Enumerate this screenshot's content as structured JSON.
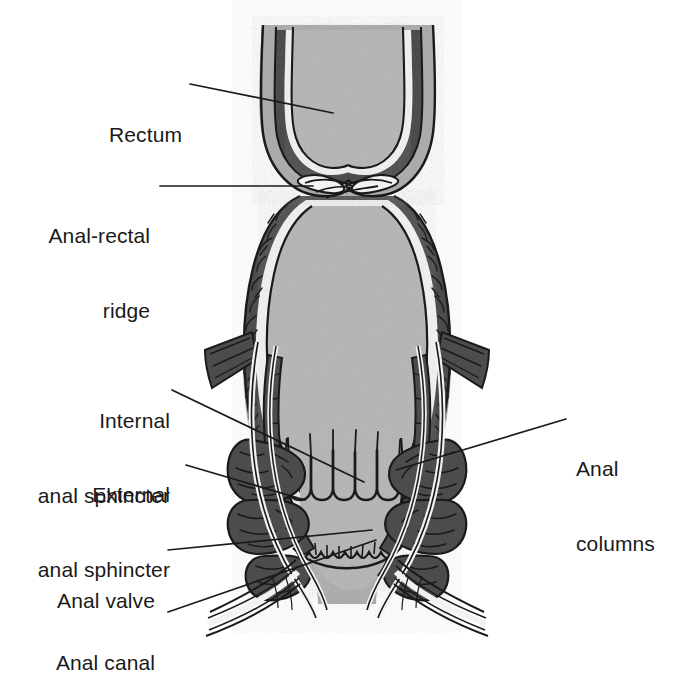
{
  "figure": {
    "type": "anatomical-diagram",
    "background_color": "#ffffff",
    "palette": {
      "outline": "#1a1a1a",
      "lumen_gray": "#b4b4b4",
      "serosa_gray": "#a9a9a9",
      "muscle_dark": "#4c4c4c",
      "muscle_mid": "#595959",
      "highlight_white": "#f2f2f2",
      "label_text": "#1a1a1a"
    }
  },
  "labels": [
    {
      "id": "rectum",
      "text": "Rectum",
      "align": "right",
      "lines": [
        "Rectum"
      ]
    },
    {
      "id": "anal-rectal-ridge",
      "text": "Anal-rectal ridge",
      "align": "right",
      "lines": [
        "Anal-rectal",
        "ridge"
      ]
    },
    {
      "id": "internal-anal-sphincter",
      "text": "Internal anal sphincter",
      "align": "right",
      "lines": [
        "Internal",
        "anal sphincter"
      ]
    },
    {
      "id": "external-anal-sphincter",
      "text": "External anal sphincter",
      "align": "right",
      "lines": [
        "External",
        "anal sphincter"
      ]
    },
    {
      "id": "anal-valve",
      "text": "Anal valve",
      "align": "right",
      "lines": [
        "Anal valve"
      ]
    },
    {
      "id": "anal-canal",
      "text": "Anal canal",
      "align": "right",
      "lines": [
        "Anal canal"
      ]
    },
    {
      "id": "anal-columns",
      "text": "Anal columns",
      "align": "left",
      "lines": [
        "Anal",
        "columns"
      ]
    }
  ],
  "label_text": {
    "rectum_l1": "Rectum",
    "ridge_l1": "Anal-rectal",
    "ridge_l2": "ridge",
    "internal_l1": "Internal",
    "internal_l2": "anal sphincter",
    "external_l1": "External",
    "external_l2": "anal sphincter",
    "valve_l1": "Anal valve",
    "canal_l1": "Anal canal",
    "columns_l1": "Anal",
    "columns_l2": "columns"
  }
}
